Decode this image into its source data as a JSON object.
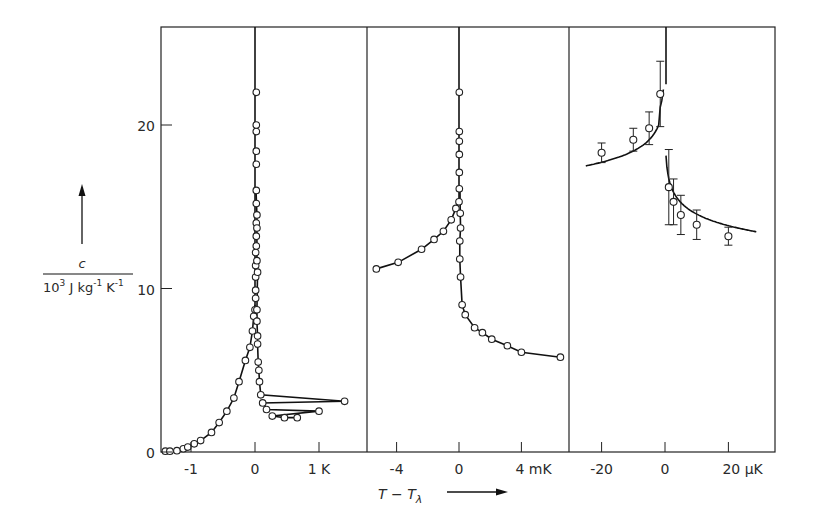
{
  "chart_data": {
    "type": "scatter",
    "title": "",
    "ylabel": {
      "numerator": "c",
      "denominator": "10³ J kg⁻¹ K⁻¹"
    },
    "xlabel": "T − Tλ",
    "ylim": [
      0,
      26
    ],
    "yticks": [
      0,
      10,
      20
    ],
    "panels": [
      {
        "name": "kelvin",
        "xunit": "K",
        "xticks": [
          {
            "v": -1,
            "label": "-1"
          },
          {
            "v": 0,
            "label": "0"
          },
          {
            "v": 1,
            "label": "1 K"
          }
        ],
        "xlim": [
          -1.45,
          1.75
        ],
        "points": [
          [
            -1.4,
            0.05
          ],
          [
            -1.33,
            0.05
          ],
          [
            -1.22,
            0.08
          ],
          [
            -1.12,
            0.2
          ],
          [
            -1.05,
            0.3
          ],
          [
            -0.95,
            0.5
          ],
          [
            -0.85,
            0.7
          ],
          [
            -0.68,
            1.2
          ],
          [
            -0.56,
            1.8
          ],
          [
            -0.44,
            2.5
          ],
          [
            -0.33,
            3.3
          ],
          [
            -0.25,
            4.3
          ],
          [
            -0.15,
            5.6
          ],
          [
            -0.08,
            6.4
          ],
          [
            -0.04,
            7.4
          ],
          [
            -0.02,
            8.3
          ],
          [
            0,
            8.7
          ],
          [
            0.01,
            9.4
          ],
          [
            0.01,
            9.9
          ],
          [
            0.01,
            10.7
          ],
          [
            0.01,
            11.4
          ],
          [
            0.01,
            12.2
          ],
          [
            0.02,
            13.2
          ],
          [
            0.02,
            14.0
          ],
          [
            0.02,
            15.2
          ],
          [
            0.02,
            16.0
          ],
          [
            0.02,
            17.6
          ],
          [
            0.02,
            18.4
          ],
          [
            0.02,
            19.6
          ],
          [
            0.02,
            20.0
          ],
          [
            0.02,
            22.0
          ],
          [
            0.03,
            14.5
          ],
          [
            0.03,
            13.7
          ],
          [
            0.02,
            12.6
          ],
          [
            0.03,
            11.7
          ],
          [
            0.04,
            11.0
          ],
          [
            0.03,
            8.7
          ],
          [
            0.03,
            8.0
          ],
          [
            0.04,
            7.1
          ],
          [
            0.04,
            6.6
          ],
          [
            0.05,
            5.5
          ],
          [
            0.06,
            5.0
          ],
          [
            0.07,
            4.3
          ],
          [
            0.09,
            3.5
          ],
          [
            0.12,
            3.0
          ],
          [
            0.18,
            2.6
          ],
          [
            0.27,
            2.2
          ],
          [
            0.46,
            2.1
          ],
          [
            0.66,
            2.1
          ],
          [
            1.0,
            2.5
          ],
          [
            1.4,
            3.1
          ]
        ]
      },
      {
        "name": "millikelvin",
        "xunit": "mK",
        "xticks": [
          {
            "v": -4,
            "label": "-4"
          },
          {
            "v": 0,
            "label": "0"
          },
          {
            "v": 4,
            "label": "4 mK"
          }
        ],
        "xlim": [
          -5.9,
          7.2
        ],
        "points": [
          [
            -5.3,
            11.2
          ],
          [
            -3.9,
            11.6
          ],
          [
            -2.4,
            12.4
          ],
          [
            -1.6,
            13.0
          ],
          [
            -1.0,
            13.5
          ],
          [
            -0.5,
            14.2
          ],
          [
            -0.2,
            14.9
          ],
          [
            0,
            15.3
          ],
          [
            0.02,
            16.1
          ],
          [
            0.02,
            17.1
          ],
          [
            0.02,
            18.2
          ],
          [
            0.02,
            19.0
          ],
          [
            0.02,
            19.6
          ],
          [
            0.02,
            22.0
          ],
          [
            0.08,
            14.6
          ],
          [
            0.1,
            13.7
          ],
          [
            0.05,
            12.9
          ],
          [
            0.05,
            11.8
          ],
          [
            0.1,
            10.7
          ],
          [
            0.2,
            9.0
          ],
          [
            0.4,
            8.4
          ],
          [
            1.0,
            7.6
          ],
          [
            1.5,
            7.3
          ],
          [
            2.1,
            6.9
          ],
          [
            3.1,
            6.5
          ],
          [
            4.0,
            6.1
          ],
          [
            6.5,
            5.8
          ]
        ]
      },
      {
        "name": "microkelvin",
        "xunit": "μK",
        "xticks": [
          {
            "v": -20,
            "label": "-20"
          },
          {
            "v": 0,
            "label": "0"
          },
          {
            "v": 20,
            "label": "20 μK"
          }
        ],
        "xlim": [
          -30,
          35
        ],
        "points": [
          {
            "x": -20,
            "y": 18.3,
            "err": 0.6
          },
          {
            "x": -10,
            "y": 19.1,
            "err": 0.7
          },
          {
            "x": -5,
            "y": 19.8,
            "err": 1.0
          },
          {
            "x": -1.5,
            "y": 21.9,
            "err": 2.0
          },
          {
            "x": 1.2,
            "y": 16.2,
            "err": 2.3
          },
          {
            "x": 2.7,
            "y": 15.3,
            "err": 1.4
          },
          {
            "x": 5,
            "y": 14.5,
            "err": 1.2
          },
          {
            "x": 10,
            "y": 13.9,
            "err": 0.9
          },
          {
            "x": 20,
            "y": 13.2,
            "err": 0.55
          }
        ]
      }
    ],
    "grid": false,
    "legend": null
  },
  "labels": {
    "y_numerator": "c",
    "y_denominator_base": "10",
    "y_denominator_exp": "3",
    "y_denominator_units": " J kg",
    "y_denominator_kexp": "-1",
    "y_denominator_k": " K",
    "x_axis": "T − T",
    "x_axis_sub": "λ"
  }
}
